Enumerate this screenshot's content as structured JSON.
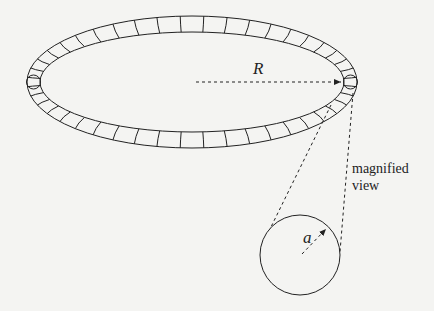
{
  "diagram": {
    "type": "toroidal-coil",
    "labels": {
      "major_radius": "R",
      "minor_radius": "a",
      "magnified_line1": "magnified",
      "magnified_line2": "view"
    },
    "torus": {
      "cx": 192,
      "cy": 82,
      "outer_rx": 165,
      "outer_ry": 66,
      "inner_rx": 152,
      "inner_ry": 50,
      "segments": 44
    },
    "magnified_circle": {
      "cx": 300,
      "cy": 255,
      "r": 40
    },
    "colors": {
      "stroke": "#222222",
      "background": "#f4f4f2"
    }
  }
}
